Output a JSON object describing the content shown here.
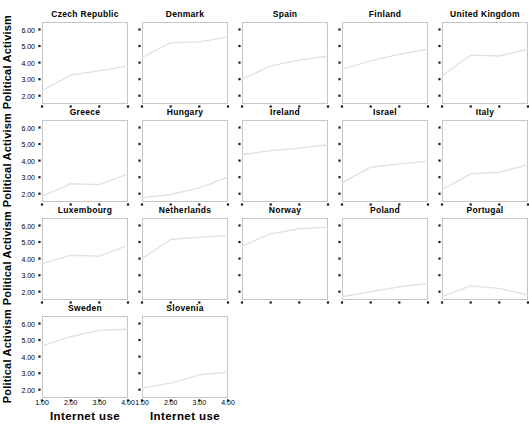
{
  "figure": {
    "y_axis_title": "Political Activism",
    "x_axis_title": "Internet use"
  },
  "chart_data": {
    "type": "line",
    "layout": "small_multiples",
    "grid_columns": 5,
    "title": "",
    "xlabel": "Internet use",
    "ylabel": "Political Activism",
    "x": [
      1,
      2,
      3,
      4
    ],
    "xlim": [
      1,
      4
    ],
    "ylim": [
      1.5,
      6.45
    ],
    "x_tick_values": [
      1,
      2,
      3,
      4
    ],
    "x_tick_labels": [
      "1.00",
      "2.00",
      "3.00",
      "4.00"
    ],
    "y_tick_values": [
      2,
      3,
      4,
      5,
      6
    ],
    "y_tick_labels": [
      "2.00",
      "3.00",
      "4.00",
      "5.00",
      "6.00"
    ],
    "grid": false,
    "legend": "none",
    "line_color": "#e2e2e2",
    "frame_color": "#c6c6c6",
    "tick_color": "#1a1a1a",
    "series": [
      {
        "name": "Czech Republic",
        "values": [
          2.3,
          3.25,
          3.5,
          3.8
        ]
      },
      {
        "name": "Denmark",
        "values": [
          4.3,
          5.2,
          5.25,
          5.55
        ]
      },
      {
        "name": "Spain",
        "values": [
          3.0,
          3.8,
          4.15,
          4.4
        ]
      },
      {
        "name": "Finland",
        "values": [
          3.6,
          4.1,
          4.5,
          4.8
        ]
      },
      {
        "name": "United Kingdom",
        "values": [
          3.2,
          4.45,
          4.4,
          4.8
        ]
      },
      {
        "name": "Greece",
        "values": [
          1.85,
          2.6,
          2.55,
          3.2
        ]
      },
      {
        "name": "Hungary",
        "values": [
          1.75,
          1.95,
          2.35,
          3.0
        ]
      },
      {
        "name": "Ireland",
        "values": [
          4.35,
          4.6,
          4.75,
          4.95
        ]
      },
      {
        "name": "Israel",
        "values": [
          2.65,
          3.6,
          3.8,
          3.95
        ]
      },
      {
        "name": "Italy",
        "values": [
          2.25,
          3.2,
          3.3,
          3.75
        ]
      },
      {
        "name": "Luxembourg",
        "values": [
          3.7,
          4.2,
          4.15,
          4.8
        ]
      },
      {
        "name": "Netherlands",
        "values": [
          4.0,
          5.15,
          5.3,
          5.4
        ]
      },
      {
        "name": "Norway",
        "values": [
          4.75,
          5.5,
          5.8,
          5.9
        ]
      },
      {
        "name": "Poland",
        "values": [
          1.7,
          2.0,
          2.3,
          2.5
        ]
      },
      {
        "name": "Portugal",
        "values": [
          1.7,
          2.35,
          2.2,
          1.8
        ]
      },
      {
        "name": "Sweden",
        "values": [
          4.65,
          5.2,
          5.6,
          5.65
        ]
      },
      {
        "name": "Slovenia",
        "values": [
          2.1,
          2.4,
          2.9,
          3.05
        ]
      }
    ]
  }
}
